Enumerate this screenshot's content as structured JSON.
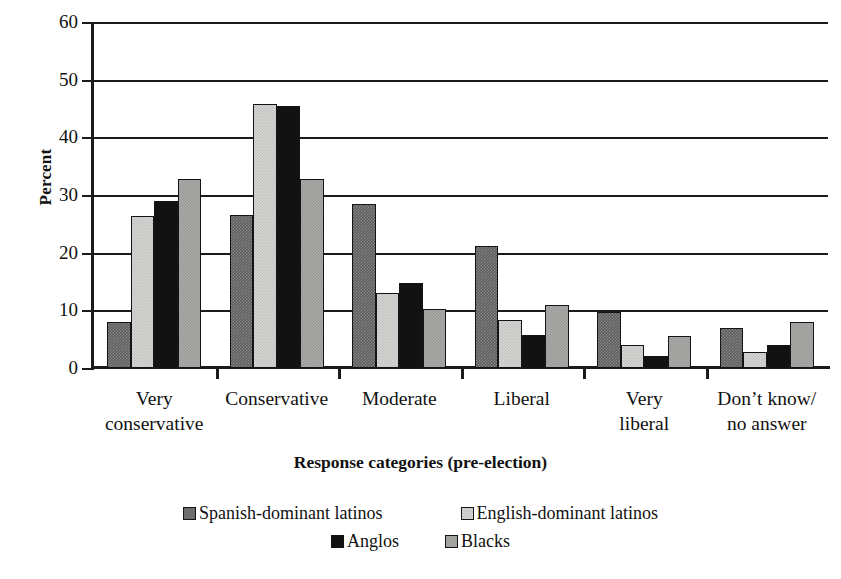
{
  "chart_data": {
    "type": "bar",
    "title": "",
    "xlabel": "Response categories (pre-election)",
    "ylabel": "Percent",
    "ylim": [
      0,
      60
    ],
    "yticks": [
      0,
      10,
      20,
      30,
      40,
      50,
      60
    ],
    "grid": true,
    "legend_position": "bottom",
    "categories": [
      "Very conservative",
      "Conservative",
      "Moderate",
      "Liberal",
      "Very liberal",
      "Don't know/ no answer"
    ],
    "category_lines": [
      [
        "Very",
        "conservative"
      ],
      [
        "Conservative"
      ],
      [
        "Moderate"
      ],
      [
        "Liberal"
      ],
      [
        "Very",
        "liberal"
      ],
      [
        "Don’t know/",
        "no answer"
      ]
    ],
    "series": [
      {
        "name": "Spanish-dominant latinos",
        "color": "#5e5e5e",
        "values": [
          8.0,
          26.5,
          28.5,
          21.2,
          9.8,
          7.0
        ]
      },
      {
        "name": "English-dominant latinos",
        "color": "#d4d4d2",
        "values": [
          26.3,
          45.7,
          13.0,
          8.3,
          4.0,
          2.8
        ]
      },
      {
        "name": "Anglos",
        "color": "#121212",
        "values": [
          28.9,
          45.4,
          14.8,
          5.7,
          2.0,
          4.0
        ]
      },
      {
        "name": "Blacks",
        "color": "#9b9b99",
        "values": [
          32.8,
          32.8,
          10.3,
          11.0,
          5.6,
          8.0
        ]
      }
    ]
  },
  "legend": {
    "row1": [
      "Spanish-dominant latinos",
      "English-dominant latinos"
    ],
    "row2": [
      "Anglos",
      "Blacks"
    ]
  }
}
